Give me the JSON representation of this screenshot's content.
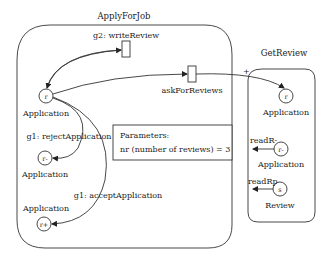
{
  "diagram": {
    "left_box": {
      "title": "ApplyForJob",
      "nodes": [
        {
          "id": "r",
          "label": "r",
          "caption": "Application"
        },
        {
          "id": "r-",
          "label": "r-",
          "caption": "Application"
        },
        {
          "id": "r+",
          "label": "r+",
          "caption": "Application"
        }
      ],
      "transitions": [
        {
          "label": "g2: writeReview"
        },
        {
          "label": "askForReviews"
        },
        {
          "label": "g1: rejectApplication"
        },
        {
          "label": "g1: acceptApplication"
        }
      ],
      "parameters": {
        "heading": "Parameters:",
        "line": "nr (number of reviews) = 3"
      }
    },
    "right_box": {
      "title": "GetReview",
      "plus_marker": "+",
      "nodes": [
        {
          "id": "r",
          "label": "r",
          "caption": "Application"
        },
        {
          "id": "r-",
          "label": "r-",
          "caption": "Application",
          "edge_label": "readR-"
        },
        {
          "id": "s",
          "label": "s",
          "caption": "Review",
          "edge_label": "readRp"
        }
      ]
    }
  }
}
